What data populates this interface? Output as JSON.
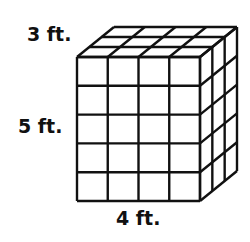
{
  "figure": {
    "type": "rectangular prism made of unit cubes",
    "labels": {
      "depth": "3 ft.",
      "height": "5 ft.",
      "width": "4 ft."
    },
    "dimensions": {
      "width": 4,
      "height": 5,
      "depth": 3
    },
    "colors": {
      "line": "#111111",
      "fill": "#ffffff"
    }
  }
}
